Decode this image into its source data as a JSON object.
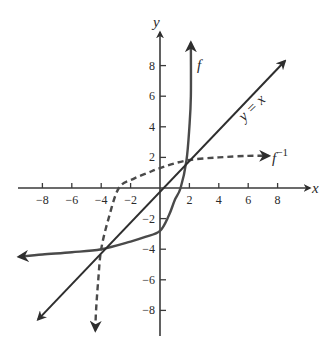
{
  "chart_data": {
    "type": "line",
    "title": "",
    "xlabel": "x",
    "ylabel": "y",
    "xlim": [
      -9.5,
      10
    ],
    "ylim": [
      -9.5,
      10.2
    ],
    "grid": false,
    "x_ticks": [
      -8,
      -6,
      -4,
      -2,
      2,
      4,
      6,
      8
    ],
    "y_ticks": [
      8,
      6,
      4,
      2,
      -2,
      -4,
      -6,
      -8
    ],
    "series": [
      {
        "name": "f",
        "style": "solid",
        "arrows": "both",
        "points": [
          [
            -9.6,
            -4.5
          ],
          [
            -8,
            -4.35
          ],
          [
            -6,
            -4.2
          ],
          [
            -4,
            -4.0
          ],
          [
            -2,
            -3.5
          ],
          [
            -1,
            -3.2
          ],
          [
            0,
            -2.8
          ],
          [
            0.6,
            -1.8
          ],
          [
            1.0,
            -0.8
          ],
          [
            1.4,
            0
          ],
          [
            1.8,
            1.8
          ],
          [
            2.0,
            4.0
          ],
          [
            2.1,
            6.0
          ],
          [
            2.1,
            9.5
          ]
        ]
      },
      {
        "name": "f^{-1}",
        "style": "dashed",
        "arrows": "both",
        "points": [
          [
            -4.4,
            -9.3
          ],
          [
            -4.35,
            -8
          ],
          [
            -4.2,
            -6
          ],
          [
            -4.0,
            -4.0
          ],
          [
            -3.5,
            -2
          ],
          [
            -2.8,
            0
          ],
          [
            -1.8,
            0.6
          ],
          [
            -0.8,
            1.0
          ],
          [
            0,
            1.3
          ],
          [
            1.8,
            1.8
          ],
          [
            4.0,
            2.0
          ],
          [
            6.0,
            2.1
          ],
          [
            7.4,
            2.1
          ]
        ]
      },
      {
        "name": "y = x",
        "style": "solid",
        "arrows": "both",
        "points": [
          [
            -8.3,
            -8.6
          ],
          [
            8.5,
            8.3
          ]
        ]
      }
    ],
    "annotations": [
      {
        "text": "f",
        "x": 2.7,
        "y": 8.2
      },
      {
        "text": "y = x",
        "x": 6.0,
        "y": 5.0,
        "rotation": -44
      },
      {
        "text": "f",
        "superscript": "−1",
        "x": 7.7,
        "y": 1.8
      }
    ]
  },
  "labels": {
    "x_axis": "x",
    "y_axis": "y",
    "f": "f",
    "f_inv_base": "f",
    "f_inv_sup": "−1",
    "identity": "y = x"
  },
  "ticks": {
    "x": [
      "−8",
      "−6",
      "−4",
      "−2",
      "2",
      "4",
      "6",
      "8"
    ],
    "y": [
      "8",
      "6",
      "4",
      "2",
      "−2",
      "−4",
      "−6",
      "−8"
    ]
  }
}
